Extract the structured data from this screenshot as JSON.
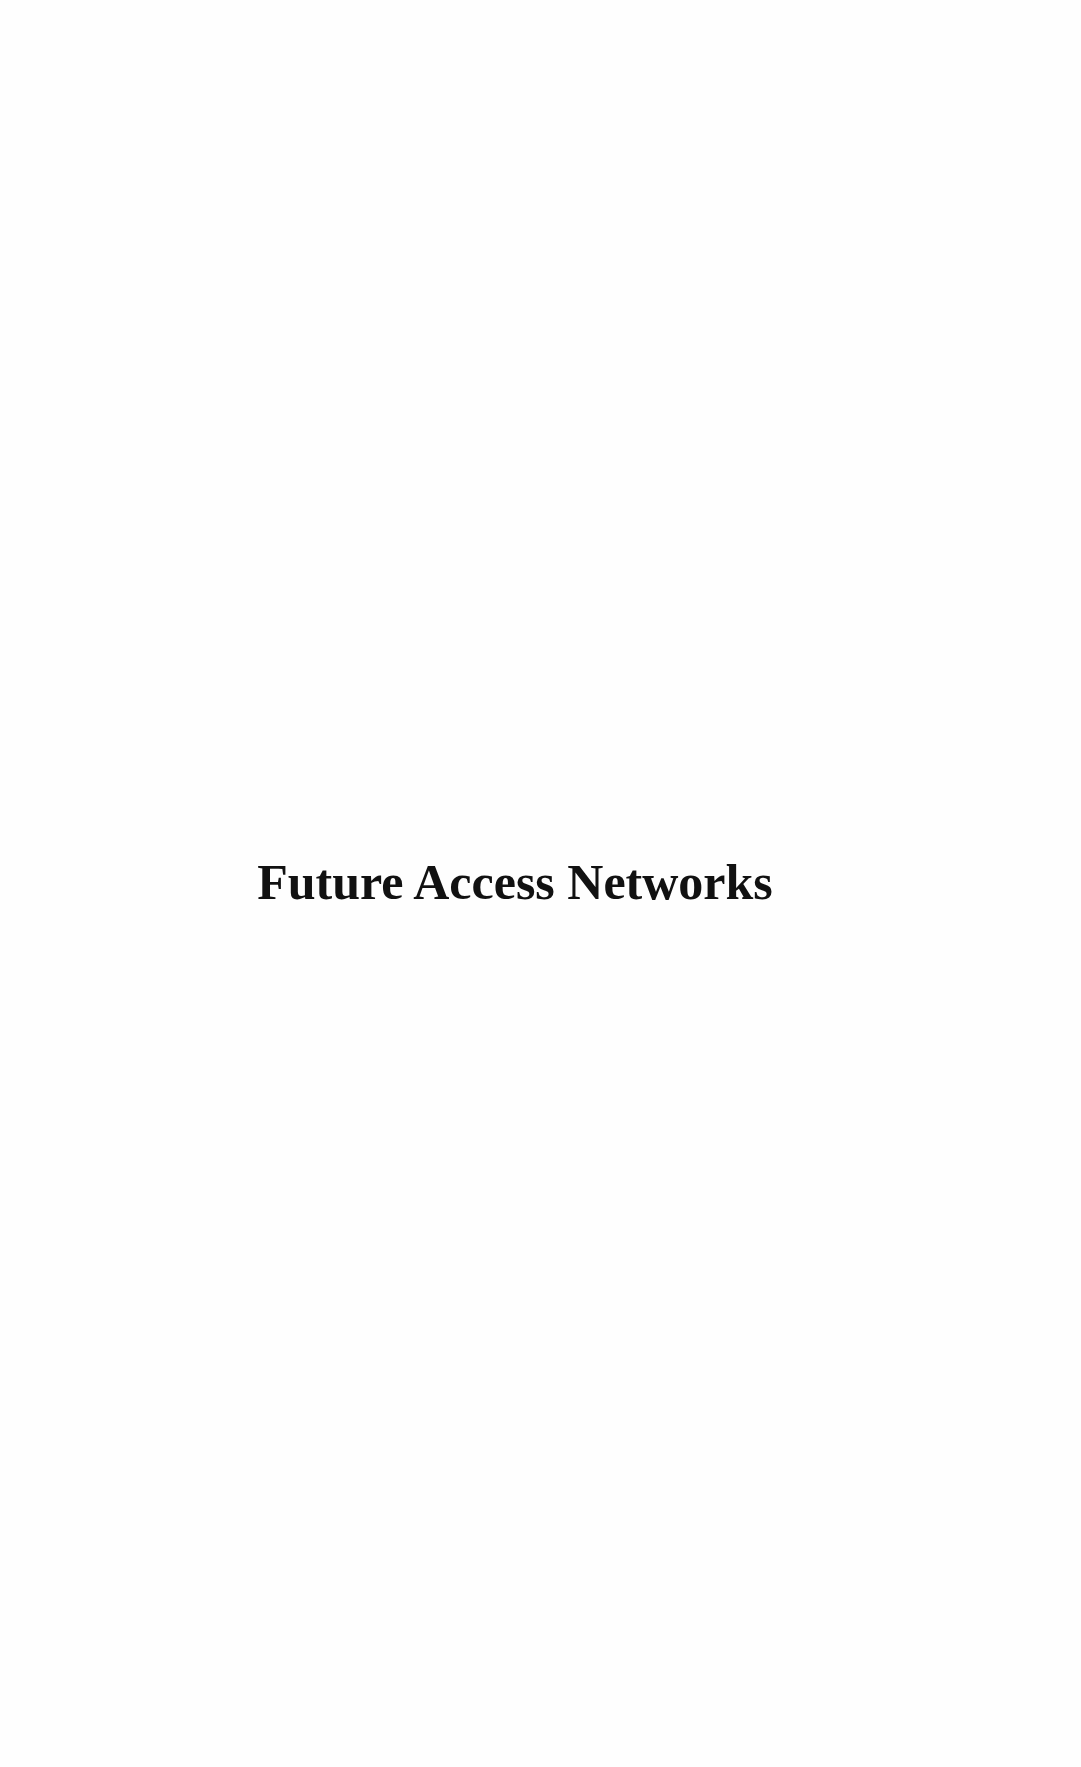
{
  "page": {
    "title": "Future Access Networks"
  },
  "colors": {
    "background": "#fefefe",
    "text": "#111111"
  }
}
